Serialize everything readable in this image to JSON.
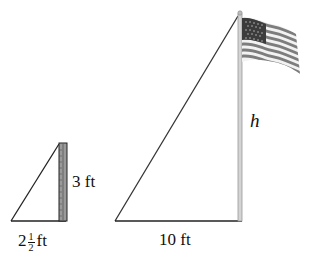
{
  "small_triangle": {
    "object": "yardstick",
    "height_label": "3 ft",
    "shadow_whole": "2",
    "shadow_num": "1",
    "shadow_den": "2",
    "shadow_unit": "ft"
  },
  "large_triangle": {
    "object": "flagpole",
    "height_label": "h",
    "shadow_label": "10 ft"
  },
  "colors": {
    "line": "#222222",
    "ruler_fill": "#8a8a8a",
    "pole": "#c8c8c8",
    "flag_stripe": "#7a7a7a",
    "flag_canton": "#3a3a3a"
  }
}
